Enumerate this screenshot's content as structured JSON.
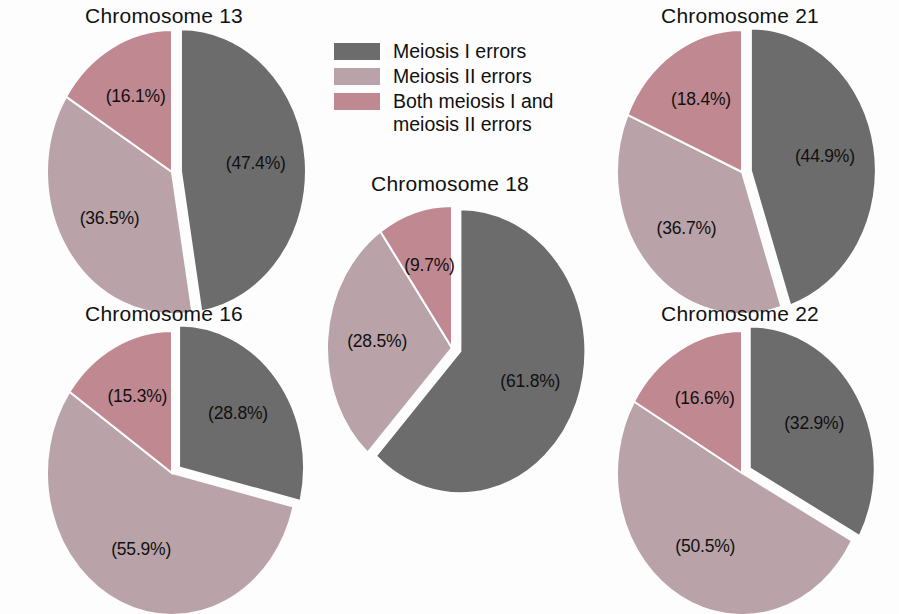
{
  "figure": {
    "background": "#fdfdfd",
    "label_format": "(%s%)"
  },
  "legend": {
    "position": "top-center",
    "items": [
      {
        "label": "Meiosis I errors",
        "color": "#6c6c6c",
        "swatch_name": "legend-swatch-meiosis-i"
      },
      {
        "label": "Meiosis II errors",
        "color": "#b9a3a8",
        "swatch_name": "legend-swatch-meiosis-ii"
      },
      {
        "label": "Both meiosis I and\nmeiosis II errors",
        "color": "#c08891",
        "swatch_name": "legend-swatch-both"
      }
    ]
  },
  "charts": [
    {
      "id": "chromosome-13",
      "title": "Chromosome 13",
      "labels": [
        "(47.4%)",
        "(36.5%)",
        "(16.1%)"
      ]
    },
    {
      "id": "chromosome-16",
      "title": "Chromosome 16",
      "labels": [
        "(28.8%)",
        "(55.9%)",
        "(15.3%)"
      ]
    },
    {
      "id": "chromosome-18",
      "title": "Chromosome 18",
      "labels": [
        "(61.8%)",
        "(28.5%)",
        "(9.7%)"
      ]
    },
    {
      "id": "chromosome-21",
      "title": "Chromosome 21",
      "labels": [
        "(44.9%)",
        "(36.7%)",
        "(18.4%)"
      ]
    },
    {
      "id": "chromosome-22",
      "title": "Chromosome 22",
      "labels": [
        "(32.9%)",
        "(50.5%)",
        "(16.6%)"
      ]
    }
  ],
  "chart_data": {
    "type": "pie",
    "title": "",
    "series_labels": [
      "Meiosis I errors",
      "Meiosis II errors",
      "Both meiosis I and meiosis II errors"
    ],
    "colors": [
      "#6c6c6c",
      "#b9a3a8",
      "#c08891"
    ],
    "exploded_slice_index": 0,
    "start_angle_deg": 0,
    "direction": "clockwise",
    "panels": [
      {
        "title": "Chromosome 13",
        "categories": [
          "Meiosis I errors",
          "Meiosis II errors",
          "Both meiosis I and meiosis II errors"
        ],
        "values": [
          47.4,
          36.5,
          16.1
        ],
        "labels": [
          "(47.4%)",
          "(36.5%)",
          "(16.1%)"
        ]
      },
      {
        "title": "Chromosome 16",
        "categories": [
          "Meiosis I errors",
          "Meiosis II errors",
          "Both meiosis I and meiosis II errors"
        ],
        "values": [
          28.8,
          55.9,
          15.3
        ],
        "labels": [
          "(28.8%)",
          "(55.9%)",
          "(15.3%)"
        ]
      },
      {
        "title": "Chromosome 18",
        "categories": [
          "Meiosis I errors",
          "Meiosis II errors",
          "Both meiosis I and meiosis II errors"
        ],
        "values": [
          61.8,
          28.5,
          9.7
        ],
        "labels": [
          "(61.8%)",
          "(28.5%)",
          "(9.7%)"
        ]
      },
      {
        "title": "Chromosome 21",
        "categories": [
          "Meiosis I errors",
          "Meiosis II errors",
          "Both meiosis I and meiosis II errors"
        ],
        "values": [
          44.9,
          36.7,
          18.4
        ],
        "labels": [
          "(44.9%)",
          "(36.7%)",
          "(18.4%)"
        ]
      },
      {
        "title": "Chromosome 22",
        "categories": [
          "Meiosis I errors",
          "Meiosis II errors",
          "Both meiosis I and meiosis II errors"
        ],
        "values": [
          32.9,
          50.5,
          16.6
        ],
        "labels": [
          "(32.9%)",
          "(50.5%)",
          "(16.6%)"
        ]
      }
    ]
  },
  "layout": {
    "panels": [
      {
        "id": "chromosome-13",
        "left": 14,
        "top": 2,
        "width": 300,
        "pie_cx": 158,
        "pie_cy": 170,
        "rx": 125,
        "ry": 142,
        "title_top": 2,
        "label_radius": 0.6
      },
      {
        "id": "chromosome-16",
        "left": 14,
        "top": 300,
        "width": 300,
        "pie_cx": 158,
        "pie_cy": 173,
        "rx": 125,
        "ry": 142,
        "title_top": 2,
        "label_radius": 0.6
      },
      {
        "id": "chromosome-18",
        "left": 300,
        "top": 170,
        "width": 300,
        "pie_cx": 152,
        "pie_cy": 178,
        "rx": 125,
        "ry": 142,
        "title_top": 2,
        "label_radius": 0.6
      },
      {
        "id": "chromosome-21",
        "left": 590,
        "top": 2,
        "width": 300,
        "pie_cx": 152,
        "pie_cy": 170,
        "rx": 125,
        "ry": 142,
        "title_top": 2,
        "label_radius": 0.6
      },
      {
        "id": "chromosome-22",
        "left": 590,
        "top": 300,
        "width": 300,
        "pie_cx": 152,
        "pie_cy": 173,
        "rx": 125,
        "ry": 142,
        "title_top": 2,
        "label_radius": 0.6
      }
    ]
  }
}
